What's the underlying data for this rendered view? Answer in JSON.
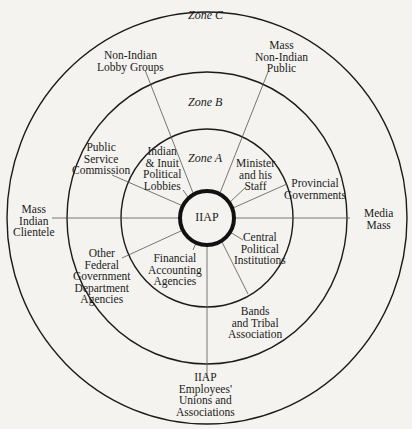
{
  "diagram": {
    "center_label": "IIAP",
    "zones": [
      {
        "id": "A",
        "label": "Zone A"
      },
      {
        "id": "B",
        "label": "Zone B"
      },
      {
        "id": "C",
        "label": "Zone C"
      }
    ],
    "zone_a_nodes": {
      "minister": "Minister\nand his\nStaff",
      "indian_inuit": "Indian\n& Inuit\nPolitical\nLobbies",
      "central_political": "Central\nPolitical\nInstitutions",
      "financial_accounting": "Financial\nAccounting\nAgencies"
    },
    "zone_b_nodes": {
      "public_service": "Public\nService\nCommission",
      "provincial": "Provincial\nGovernments",
      "other_federal": "Other\nFederal\nGovernment\nDepartment\nAgencies",
      "bands_tribal": "Bands\nand Tribal\nAssociation"
    },
    "zone_c_nodes": {
      "non_indian_lobby": "Non-Indian\nLobby Groups",
      "mass_non_indian": "Mass\nNon-Indian\nPublic",
      "mass_indian": "Mass\nIndian\nClientele",
      "media": "Media\nMass",
      "employees_unions": "IIAP\nEmployees'\nUnions and\nAssociations"
    },
    "colors": {
      "ink": "#1b1b1b",
      "paper": "#f4f3ef",
      "spoke": "#555555"
    }
  }
}
